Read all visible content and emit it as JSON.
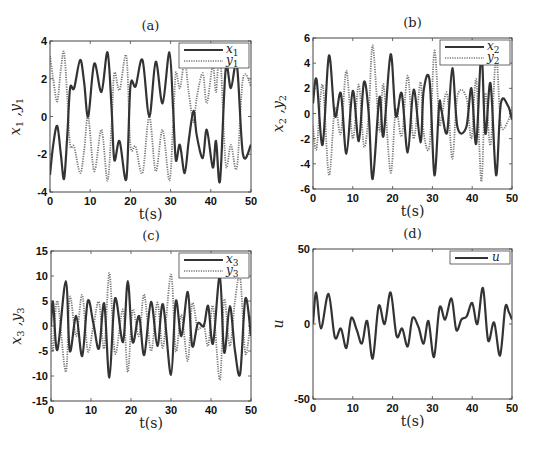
{
  "chart_data": [
    {
      "type": "line",
      "panel": "a",
      "title": "(a)",
      "xlabel": "t(s)",
      "ylabel": "x1 ,y1",
      "xlim": [
        0,
        50
      ],
      "ylim": [
        -4,
        4
      ],
      "xticks": [
        0,
        10,
        20,
        30,
        40,
        50
      ],
      "yticks": [
        -4,
        -2,
        0,
        2,
        4
      ],
      "grid": false,
      "legend_position": "top-right",
      "series": [
        {
          "name": "x1",
          "style": "solid",
          "x": [
            0,
            0.8,
            1.8,
            2.7,
            3.5,
            4.3,
            5,
            6,
            7.5,
            8.5,
            9.5,
            11,
            12.8,
            14.3,
            15.3,
            16,
            17.3,
            19,
            20,
            21.3,
            23,
            24.7,
            26.3,
            28,
            29.7,
            30.6,
            31.3,
            32.3,
            33.5,
            34.5,
            35.7,
            36.5,
            38,
            39,
            40.5,
            41.3,
            42.3,
            43.7,
            45,
            46.5,
            48,
            50
          ],
          "y": [
            -3.1,
            -1.5,
            -0.5,
            -2.0,
            -3.3,
            -1.0,
            1.5,
            1.5,
            3.0,
            1.8,
            0.0,
            2.8,
            1.3,
            3.4,
            0.5,
            -2.3,
            -1.3,
            -3.3,
            1.6,
            1.6,
            3.0,
            0.0,
            2.9,
            0.7,
            3.4,
            0.5,
            -2.3,
            -1.5,
            -3.0,
            -1.3,
            0.3,
            -1.0,
            -2.2,
            -0.7,
            -2.7,
            -1.3,
            -3.4,
            2.5,
            1.5,
            2.7,
            -2.0,
            -1.5
          ]
        },
        {
          "name": "y1",
          "style": "dotted",
          "x": [
            0,
            0.8,
            1.8,
            2.7,
            3.5,
            4.3,
            5,
            6,
            7.5,
            8.5,
            9.5,
            11,
            12.8,
            14.3,
            15.3,
            16,
            17.3,
            19,
            20,
            21.3,
            23,
            24.7,
            26.3,
            28,
            29.7,
            30.6,
            31.3,
            32.3,
            33.5,
            34.5,
            35.7,
            36.5,
            38,
            39,
            40.5,
            41.3,
            42.3,
            43.7,
            45,
            46.5,
            48,
            50
          ],
          "y": [
            3.2,
            2.0,
            0.8,
            2.5,
            3.4,
            1.0,
            -1.5,
            -1.6,
            -3.0,
            -1.8,
            0.0,
            -2.9,
            -0.7,
            -3.4,
            -0.5,
            2.3,
            1.4,
            3.2,
            -1.5,
            -1.6,
            -3.0,
            0.0,
            -2.9,
            -0.7,
            -3.4,
            -0.5,
            2.3,
            1.5,
            2.9,
            1.3,
            -0.3,
            1.0,
            2.3,
            0.7,
            2.7,
            1.3,
            3.4,
            -2.5,
            -1.5,
            -2.7,
            2.0,
            1.6
          ]
        }
      ]
    },
    {
      "type": "line",
      "panel": "b",
      "title": "(b)",
      "xlabel": "t(s)",
      "ylabel": "x2 ,y2",
      "xlim": [
        0,
        50
      ],
      "ylim": [
        -6,
        6
      ],
      "xticks": [
        0,
        10,
        20,
        30,
        40,
        50
      ],
      "yticks": [
        -6,
        -4,
        -2,
        0,
        2,
        4,
        6
      ],
      "grid": false,
      "legend_position": "top-right",
      "series": [
        {
          "name": "x2",
          "style": "solid",
          "x": [
            0,
            0.9,
            2.4,
            4.0,
            5.5,
            7.0,
            8.4,
            10,
            11.5,
            12.8,
            14.0,
            15.0,
            16.7,
            17.7,
            19.5,
            20.8,
            22.3,
            23.8,
            25.3,
            27.0,
            27.8,
            29.3,
            30.5,
            31.7,
            32.3,
            33.7,
            35.0,
            36.3,
            38.5,
            39.8,
            41.0,
            42.3,
            43.3,
            44.6,
            46.0,
            47.2,
            49.0,
            50
          ],
          "y": [
            0.8,
            2.7,
            -2.5,
            4.6,
            -0.2,
            1.6,
            -3.2,
            1.8,
            -2.2,
            2.5,
            0.0,
            -5.2,
            1.3,
            -1.8,
            4.7,
            -0.2,
            1.6,
            -3.1,
            1.9,
            -2.3,
            1.8,
            2.6,
            -4.9,
            0.7,
            0.2,
            -1.5,
            3.6,
            -1.1,
            -1.1,
            2.0,
            -2.4,
            4.8,
            -1.6,
            2.4,
            -4.9,
            0.8,
            0.6,
            -0.5
          ]
        },
        {
          "name": "y2",
          "style": "dotted",
          "x": [
            0,
            0.9,
            2.4,
            4.0,
            5.5,
            7.0,
            8.4,
            10,
            11.5,
            12.8,
            14.0,
            15.0,
            16.7,
            17.7,
            19.5,
            20.8,
            22.3,
            23.8,
            25.3,
            27.0,
            27.8,
            29.3,
            30.5,
            31.7,
            32.3,
            33.7,
            35.0,
            36.3,
            38.5,
            39.8,
            41.0,
            42.3,
            43.3,
            44.6,
            46.0,
            47.2,
            49.0,
            50
          ],
          "y": [
            -1.0,
            -2.8,
            2.3,
            -4.9,
            0.4,
            -1.6,
            3.4,
            -2.0,
            2.3,
            -2.6,
            0.0,
            5.4,
            -1.4,
            2.3,
            -4.7,
            0.3,
            -1.8,
            3.0,
            -2.0,
            2.5,
            -1.5,
            -2.5,
            5.0,
            -0.6,
            -0.3,
            1.6,
            -3.6,
            1.4,
            1.3,
            -2.0,
            2.7,
            -5.4,
            1.6,
            -2.5,
            4.5,
            -0.9,
            -0.6,
            0.5
          ]
        }
      ]
    },
    {
      "type": "line",
      "panel": "c",
      "title": "(c)",
      "xlabel": "t(s)",
      "ylabel": "x3 ,y3",
      "xlim": [
        0,
        50
      ],
      "ylim": [
        -15,
        15
      ],
      "xticks": [
        0,
        10,
        20,
        30,
        40,
        50
      ],
      "yticks": [
        -15,
        -10,
        -5,
        0,
        5,
        10,
        15
      ],
      "grid": false,
      "legend_position": "top-right",
      "series": [
        {
          "name": "x3",
          "style": "solid",
          "x": [
            0,
            0.5,
            1.6,
            3.7,
            4.7,
            6.3,
            7.8,
            9.2,
            10.6,
            12.0,
            13.3,
            14.6,
            16.0,
            18.0,
            19.2,
            20.4,
            22.0,
            23.3,
            25.0,
            26.6,
            28.0,
            30.0,
            31.2,
            32.6,
            34.2,
            35.3,
            36.7,
            38.2,
            39.3,
            40.5,
            42.2,
            43.3,
            44.7,
            46.0,
            47.3,
            48.6,
            50
          ],
          "y": [
            0,
            4.8,
            -4.8,
            9.0,
            -5.0,
            2.0,
            -6.0,
            5.0,
            0.5,
            -4.5,
            4.5,
            -10.3,
            5.5,
            -3.2,
            9.0,
            -3.2,
            2.0,
            -5.8,
            4.8,
            -4.0,
            4.3,
            -9.8,
            5.0,
            -2.0,
            6.8,
            -4.0,
            0.5,
            0.0,
            4.0,
            -3.5,
            10.0,
            -5.3,
            4.0,
            -5.0,
            -9.5,
            5.5,
            -2.0
          ]
        },
        {
          "name": "y3",
          "style": "dotted",
          "x": [
            0,
            0.5,
            1.6,
            3.7,
            4.7,
            6.3,
            7.8,
            9.2,
            10.6,
            12.0,
            13.3,
            14.6,
            16.0,
            18.0,
            19.2,
            20.4,
            22.0,
            23.3,
            25.0,
            26.6,
            28.0,
            30.0,
            31.2,
            32.6,
            34.2,
            35.3,
            36.7,
            38.2,
            39.3,
            40.5,
            42.2,
            43.3,
            44.7,
            46.0,
            47.3,
            48.6,
            50
          ],
          "y": [
            0,
            -5.0,
            5.0,
            -9.2,
            5.8,
            -2.0,
            6.2,
            -5.0,
            0.0,
            4.8,
            -4.5,
            10.6,
            -5.5,
            3.3,
            -9.2,
            3.2,
            -2.0,
            6.3,
            -5.0,
            4.7,
            -4.3,
            10.3,
            -5.0,
            2.2,
            -7.0,
            4.5,
            -0.5,
            0.2,
            -4.0,
            4.0,
            -10.8,
            5.3,
            -4.0,
            5.0,
            9.7,
            -5.5,
            2.0
          ]
        }
      ]
    },
    {
      "type": "line",
      "panel": "d",
      "title": "(d)",
      "xlabel": "t(s)",
      "ylabel": "u",
      "xlim": [
        0,
        50
      ],
      "ylim": [
        -50,
        50
      ],
      "xticks": [
        0,
        10,
        20,
        30,
        40,
        50
      ],
      "yticks": [
        -50,
        0,
        50
      ],
      "grid": false,
      "legend_position": "top-right",
      "series": [
        {
          "name": "u",
          "style": "solid",
          "x": [
            0,
            0.8,
            2.0,
            3.9,
            5.5,
            7.0,
            8.4,
            9.6,
            11.0,
            12.3,
            13.6,
            15.0,
            16.5,
            18.0,
            19.5,
            21.0,
            22.4,
            23.8,
            25.0,
            26.5,
            27.8,
            29.0,
            30.4,
            31.8,
            33.2,
            34.8,
            36.0,
            37.3,
            38.6,
            40.0,
            41.3,
            42.7,
            44.0,
            45.5,
            47.0,
            48.3,
            49.2,
            50
          ],
          "y": [
            0,
            21,
            -3,
            20,
            -9,
            -3,
            -16,
            4,
            -4,
            -13,
            2,
            -23,
            12,
            0,
            21,
            -8,
            -3,
            -15,
            4,
            -2,
            -13,
            2,
            -22,
            11,
            3,
            17,
            -4,
            3,
            5,
            14,
            0,
            24,
            -11,
            1,
            -21,
            11,
            8,
            3
          ]
        }
      ]
    }
  ],
  "panels": {
    "a": {
      "title": "(a)",
      "xlabel": "t(s)",
      "legend": [
        "x1",
        "y1"
      ]
    },
    "b": {
      "title": "(b)",
      "xlabel": "t(s)",
      "legend": [
        "x2",
        "y2"
      ]
    },
    "c": {
      "title": "(c)",
      "xlabel": "t(s)",
      "legend": [
        "x3",
        "y3"
      ]
    },
    "d": {
      "title": "(d)",
      "xlabel": "t(s)",
      "legend": [
        "u"
      ]
    }
  },
  "colors": {
    "solid_line": "#333333",
    "dotted_line": "#777777",
    "axis": "#444444",
    "background": "#ffffff"
  }
}
